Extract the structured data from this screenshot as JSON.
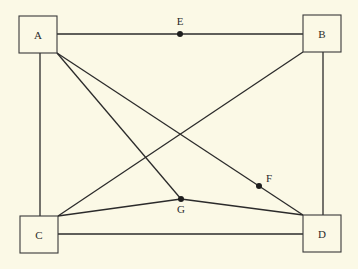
{
  "diagram": {
    "type": "graph",
    "nodes_boxed": [
      {
        "id": "A",
        "label": "A",
        "x": 19,
        "y": 16,
        "w": 38,
        "h": 37
      },
      {
        "id": "B",
        "label": "B",
        "x": 303,
        "y": 15,
        "w": 38,
        "h": 37
      },
      {
        "id": "C",
        "label": "C",
        "x": 20,
        "y": 216,
        "w": 38,
        "h": 37
      },
      {
        "id": "D",
        "label": "D",
        "x": 303,
        "y": 215,
        "w": 38,
        "h": 37
      }
    ],
    "points": [
      {
        "id": "E",
        "label": "E",
        "x": 180,
        "y": 34
      },
      {
        "id": "F",
        "label": "F",
        "x": 259,
        "y": 186
      },
      {
        "id": "G",
        "label": "G",
        "x": 181,
        "y": 199
      }
    ],
    "edges": [
      [
        "A",
        "E"
      ],
      [
        "E",
        "B"
      ],
      [
        "A",
        "C"
      ],
      [
        "B",
        "D"
      ],
      [
        "C",
        "D"
      ],
      [
        "A",
        "G"
      ],
      [
        "A",
        "F"
      ],
      [
        "F",
        "D"
      ],
      [
        "C",
        "B"
      ],
      [
        "C",
        "G"
      ],
      [
        "G",
        "D"
      ]
    ]
  }
}
